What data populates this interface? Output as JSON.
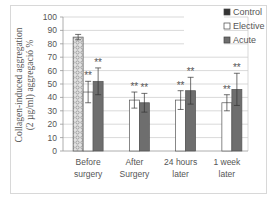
{
  "chart_data": {
    "type": "bar",
    "title": "",
    "xlabel": "",
    "ylabel": "Collagen-induced aggregation (2 µg/ml) aggregació %",
    "ylabel_lines": [
      "Collagen-induced aggregation",
      "(2 µg/ml) aggregació %"
    ],
    "ylim": [
      0,
      100
    ],
    "yticks": [
      0,
      10,
      20,
      30,
      40,
      50,
      60,
      70,
      80,
      90,
      100
    ],
    "grid": true,
    "legend_position": "top-right",
    "categories": [
      "Before surgery",
      "After Surgery",
      "24 hours later",
      "1 week later"
    ],
    "category_lines": [
      [
        "Before",
        "surgery"
      ],
      [
        "After",
        "Surgery"
      ],
      [
        "24 hours",
        "later"
      ],
      [
        "1 week",
        "later"
      ]
    ],
    "series": [
      {
        "name": "Control",
        "values": [
          85,
          null,
          null,
          null
        ],
        "errors": [
          2,
          null,
          null,
          null
        ],
        "pattern": "dotted"
      },
      {
        "name": "Elective",
        "values": [
          44,
          38,
          38,
          36
        ],
        "errors": [
          8,
          6,
          7,
          6
        ],
        "pattern": "white"
      },
      {
        "name": "Acute",
        "values": [
          52,
          36,
          45,
          46
        ],
        "errors": [
          10,
          7,
          10,
          12
        ],
        "pattern": "dark-gray"
      }
    ],
    "annotations": [
      {
        "category": "Before surgery",
        "series": "Elective",
        "text": "**"
      },
      {
        "category": "Before surgery",
        "series": "Acute",
        "text": "**"
      },
      {
        "category": "After Surgery",
        "series": "Elective",
        "text": "**"
      },
      {
        "category": "After Surgery",
        "series": "Acute",
        "text": "**"
      },
      {
        "category": "24 hours later",
        "series": "Elective",
        "text": "**"
      },
      {
        "category": "24 hours later",
        "series": "Acute",
        "text": "**"
      },
      {
        "category": "1 week later",
        "series": "Elective",
        "text": "**"
      },
      {
        "category": "1 week later",
        "series": "Acute",
        "text": "**"
      }
    ]
  },
  "legend": [
    {
      "label": "Control"
    },
    {
      "label": "Elective"
    },
    {
      "label": "Acute"
    }
  ],
  "colors": {
    "acute": "#6e6e6e",
    "elective": "#ffffff",
    "control_bg": "#d9d9d9",
    "grid": "#cfcfcf",
    "text": "#555555"
  }
}
